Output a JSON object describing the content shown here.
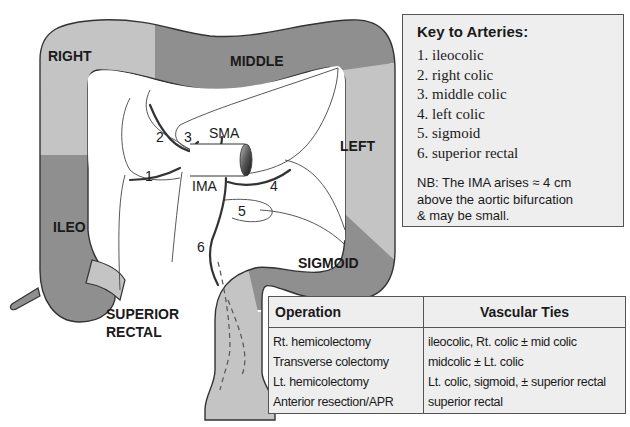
{
  "diagram": {
    "region_labels": {
      "right": "RIGHT",
      "middle": "MIDDLE",
      "left": "LEFT",
      "ileo": "ILEO",
      "sigmoid": "SIGMOID",
      "superior_rectal_line1": "SUPERIOR",
      "superior_rectal_line2": "RECTAL"
    },
    "vessel_labels": {
      "sma": "SMA",
      "ima": "IMA"
    },
    "artery_numbers": [
      "1",
      "2",
      "3",
      "4",
      "5",
      "6"
    ],
    "colors": {
      "light_segment": "#c4c4c4",
      "dark_segment": "#8f8f8f",
      "outline": "#333333",
      "mesentery": "#ffffff",
      "box_bg": "#eeeeee"
    }
  },
  "key": {
    "title": "Key to Arteries:",
    "items": [
      "1. ileocolic",
      "2. right colic",
      "3. middle colic",
      "4. left colic",
      "5. sigmoid",
      "6. superior rectal"
    ],
    "note_line1": "NB: The IMA arises ≈ 4 cm",
    "note_line2": "above the aortic bifurcation",
    "note_line3": "& may be small."
  },
  "operations_table": {
    "headers": [
      "Operation",
      "Vascular Ties"
    ],
    "rows": [
      {
        "operation": "Rt. hemicolectomy",
        "ties": "ileocolic, Rt. colic ± mid colic"
      },
      {
        "operation": "Transverse colectomy",
        "ties": "midcolic ± Lt. colic"
      },
      {
        "operation": "Lt. hemicolectomy",
        "ties": "Lt. colic, sigmoid, ± superior rectal"
      },
      {
        "operation": "Anterior resection/APR",
        "ties": "superior rectal"
      }
    ]
  }
}
